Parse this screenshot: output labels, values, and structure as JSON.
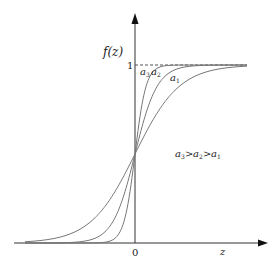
{
  "chart_data": {
    "type": "line",
    "title": "",
    "xlabel": "z",
    "ylabel": "f(z)",
    "x_tick_labels": [
      "0"
    ],
    "y_tick_labels": [
      "1"
    ],
    "asymptote": {
      "y": 1,
      "style": "dashed"
    },
    "function": "logistic sigmoid f(z) = 1/(1+exp(-a z))",
    "series": [
      {
        "name": "a1",
        "label": "a",
        "subscript": "1",
        "slope": 0.045
      },
      {
        "name": "a2",
        "label": "a",
        "subscript": "2",
        "slope": 0.09
      },
      {
        "name": "a3",
        "label": "a",
        "subscript": "3",
        "slope": 0.18
      }
    ],
    "annotation": {
      "text": "a3 > a2 > a1"
    },
    "xlim": [
      -121,
      133
    ],
    "ylim": [
      0,
      1.2
    ],
    "grid": false,
    "legend": "inline labels"
  },
  "labels": {
    "y_axis": "f(z)",
    "x_axis": "z",
    "zero": "0",
    "one": "1",
    "a": "a",
    "sub1": "1",
    "sub2": "2",
    "sub3": "3",
    "gt": ">"
  },
  "colors": {
    "axis": "#222222",
    "curve": "#777777",
    "dash": "#555555"
  }
}
